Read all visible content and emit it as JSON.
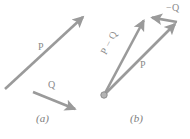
{
  "figure": {
    "background": "#ffffff",
    "stroke_color": "#9a9a9a",
    "label_color": "#8a8a8a",
    "caption_color": "#7d7d7d",
    "width": 190,
    "height": 139
  },
  "panel_a": {
    "caption": "(a)",
    "vectors": [
      {
        "label": "P",
        "name": "vector-p",
        "x1": 5,
        "y1": 89,
        "x2": 85,
        "y2": 15
      },
      {
        "label": "Q",
        "name": "vector-q",
        "x1": 33,
        "y1": 92,
        "x2": 78,
        "y2": 110
      }
    ]
  },
  "panel_b": {
    "caption": "(b)",
    "origin": {
      "x": 104,
      "y": 95,
      "r": 3.2
    },
    "vectors": [
      {
        "label": "P − Q",
        "name": "vector-p-minus-q",
        "x1": 104,
        "y1": 95,
        "x2": 145,
        "y2": 17
      },
      {
        "label": "P",
        "name": "vector-p",
        "x1": 104,
        "y1": 95,
        "x2": 177,
        "y2": 22
      },
      {
        "label": "−Q",
        "name": "vector-minus-q",
        "x1": 177,
        "y1": 22,
        "x2": 149,
        "y2": 17
      }
    ]
  }
}
